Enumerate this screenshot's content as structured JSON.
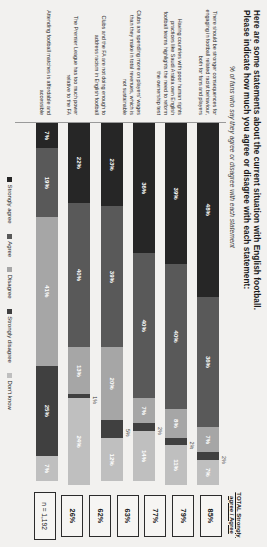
{
  "header": {
    "title_line1": "Here are some statements about the current situation with English football.",
    "title_line2": "Please indicate how much you agree or disagree with each statement:",
    "subtitle": "% of fans who say they agree or disagree with each statement"
  },
  "total_column": {
    "header": "TOTAL Strongly agree / Agree",
    "sample": "n = 1,192"
  },
  "legend": {
    "items": [
      {
        "label": "Strongly agree",
        "color": "#262626"
      },
      {
        "label": "Agree",
        "color": "#595959"
      },
      {
        "label": "Disagree",
        "color": "#a6a6a6"
      },
      {
        "label": "Strongly disagree",
        "color": "#404040"
      },
      {
        "label": "Don't know",
        "color": "#bfbfbf"
      }
    ]
  },
  "chart_data": {
    "type": "bar",
    "title": "Here are some statements about the current situation with English football. Please indicate how much you agree or disagree with each statement:",
    "subtitle": "% of fans who say they agree or disagree with each statement",
    "xlabel": "",
    "ylabel": "",
    "xlim": [
      0,
      100
    ],
    "grid": false,
    "legend_position": "bottom",
    "stacked": true,
    "orientation": "horizontal",
    "categories": [
      "There should be stronger consequences for engaging in football related racist behaviour, both for fans and players",
      "Having countries with poor human rights practices like Saudi Arabia own English football teams highlights the need to reform the ownership test",
      "Clubs are spending more on players' wages than they make in total revenues, which is not sustainable",
      "Clubs and the FA are not doing enough to address racism in English football",
      "The Premier League has too much power relative to the FA",
      "Attending football matches is affordable and accessible"
    ],
    "series": [
      {
        "name": "Strongly agree",
        "color": "#262626",
        "values": [
          48,
          39,
          36,
          23,
          22,
          7
        ]
      },
      {
        "name": "Agree",
        "color": "#595959",
        "values": [
          36,
          40,
          40,
          39,
          40,
          19
        ]
      },
      {
        "name": "Disagree",
        "color": "#a6a6a6",
        "values": [
          7,
          8,
          7,
          20,
          13,
          41
        ]
      },
      {
        "name": "Strongly disagree",
        "color": "#404040",
        "values": [
          2,
          2,
          2,
          5,
          1,
          25
        ]
      },
      {
        "name": "Don't know",
        "color": "#bfbfbf",
        "values": [
          7,
          11,
          14,
          12,
          24,
          7
        ]
      }
    ],
    "totals": [
      "85%",
      "79%",
      "77%",
      "63%",
      "62%",
      "26%"
    ],
    "sample_size": "n = 1,192"
  },
  "rows": [
    {
      "statement": "There should be stronger consequences for engaging in football related racist behaviour, both for fans and players",
      "total": "85%",
      "segments": [
        {
          "key": "strongly_agree",
          "label": "48%",
          "value": 48,
          "color": "#262626",
          "inside": true
        },
        {
          "key": "agree",
          "label": "36%",
          "value": 36,
          "color": "#595959",
          "inside": true
        },
        {
          "key": "disagree",
          "label": "7%",
          "value": 7,
          "color": "#a6a6a6",
          "inside": true
        },
        {
          "key": "strongly_disagree",
          "label": "2%",
          "value": 2,
          "color": "#404040",
          "inside": false
        },
        {
          "key": "dont_know",
          "label": "7%",
          "value": 7,
          "color": "#bfbfbf",
          "inside": true
        }
      ]
    },
    {
      "statement": "Having countries with poor human rights practices like Saudi Arabia own English football teams highlights the need to reform the ownership test",
      "total": "79%",
      "segments": [
        {
          "key": "strongly_agree",
          "label": "39%",
          "value": 39,
          "color": "#262626",
          "inside": true
        },
        {
          "key": "agree",
          "label": "40%",
          "value": 40,
          "color": "#595959",
          "inside": true
        },
        {
          "key": "disagree",
          "label": "8%",
          "value": 8,
          "color": "#a6a6a6",
          "inside": true
        },
        {
          "key": "strongly_disagree",
          "label": "2%",
          "value": 2,
          "color": "#404040",
          "inside": false
        },
        {
          "key": "dont_know",
          "label": "11%",
          "value": 11,
          "color": "#bfbfbf",
          "inside": true
        }
      ]
    },
    {
      "statement": "Clubs are spending more on players' wages than they make in total revenues, which is not sustainable",
      "total": "77%",
      "segments": [
        {
          "key": "strongly_agree",
          "label": "36%",
          "value": 36,
          "color": "#262626",
          "inside": true
        },
        {
          "key": "agree",
          "label": "40%",
          "value": 40,
          "color": "#595959",
          "inside": true
        },
        {
          "key": "disagree",
          "label": "7%",
          "value": 7,
          "color": "#a6a6a6",
          "inside": true
        },
        {
          "key": "strongly_disagree",
          "label": "2%",
          "value": 2,
          "color": "#404040",
          "inside": false
        },
        {
          "key": "dont_know",
          "label": "14%",
          "value": 14,
          "color": "#bfbfbf",
          "inside": true
        }
      ]
    },
    {
      "statement": "Clubs and the FA are not doing enough to address racism in English football",
      "total": "63%",
      "segments": [
        {
          "key": "strongly_agree",
          "label": "23%",
          "value": 23,
          "color": "#262626",
          "inside": true
        },
        {
          "key": "agree",
          "label": "39%",
          "value": 39,
          "color": "#595959",
          "inside": true
        },
        {
          "key": "disagree",
          "label": "20%",
          "value": 20,
          "color": "#a6a6a6",
          "inside": true
        },
        {
          "key": "strongly_disagree",
          "label": "5%",
          "value": 5,
          "color": "#404040",
          "inside": false
        },
        {
          "key": "dont_know",
          "label": "12%",
          "value": 12,
          "color": "#bfbfbf",
          "inside": true
        }
      ]
    },
    {
      "statement": "The Premier League has too much power relative to the FA",
      "total": "62%",
      "segments": [
        {
          "key": "strongly_agree",
          "label": "22%",
          "value": 22,
          "color": "#262626",
          "inside": true
        },
        {
          "key": "agree",
          "label": "40%",
          "value": 40,
          "color": "#595959",
          "inside": true
        },
        {
          "key": "disagree",
          "label": "13%",
          "value": 13,
          "color": "#a6a6a6",
          "inside": true
        },
        {
          "key": "strongly_disagree",
          "label": "1%",
          "value": 1,
          "color": "#404040",
          "inside": false
        },
        {
          "key": "dont_know",
          "label": "24%",
          "value": 24,
          "color": "#bfbfbf",
          "inside": true
        }
      ]
    },
    {
      "statement": "Attending football matches is affordable and accessible",
      "total": "26%",
      "segments": [
        {
          "key": "strongly_agree",
          "label": "7%",
          "value": 7,
          "color": "#262626",
          "inside": true
        },
        {
          "key": "agree",
          "label": "19%",
          "value": 19,
          "color": "#595959",
          "inside": true
        },
        {
          "key": "disagree",
          "label": "41%",
          "value": 41,
          "color": "#a6a6a6",
          "inside": true
        },
        {
          "key": "strongly_disagree",
          "label": "25%",
          "value": 25,
          "color": "#404040",
          "inside": true
        },
        {
          "key": "dont_know",
          "label": "7%",
          "value": 7,
          "color": "#bfbfbf",
          "inside": true
        }
      ]
    }
  ]
}
